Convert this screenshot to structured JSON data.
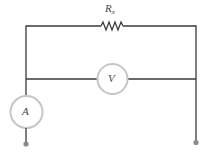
{
  "diagram": {
    "type": "circuit-schematic",
    "title": "",
    "components": {
      "resistor": {
        "label": "R",
        "subscript": "x",
        "position": "top branch"
      },
      "voltmeter": {
        "label": "V",
        "position": "middle branch, parallel to resistor"
      },
      "ammeter": {
        "label": "A",
        "position": "left lead, in series"
      }
    },
    "terminals": [
      {
        "id": "left-terminal",
        "position": "bottom-left"
      },
      {
        "id": "right-terminal",
        "position": "bottom-right"
      }
    ],
    "colors": {
      "wire": "#3a3a3a",
      "meter_outline": "#c6c6c6",
      "terminal": "#8a8a8a",
      "label": "#444444"
    }
  }
}
